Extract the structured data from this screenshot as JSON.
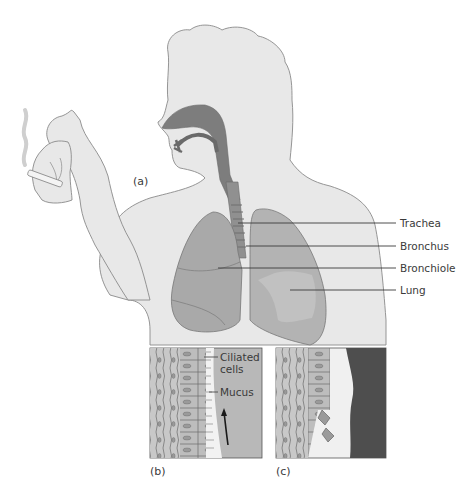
{
  "figure": {
    "panels": [
      {
        "id": "a",
        "label": "(a)"
      },
      {
        "id": "b",
        "label": "(b)"
      },
      {
        "id": "c",
        "label": "(c)"
      }
    ],
    "labels": {
      "trachea": "Trachea",
      "bronchus": "Bronchus",
      "bronchiole": "Bronchiole",
      "lung": "Lung",
      "ciliated_cells_line1": "Ciliated",
      "ciliated_cells_line2": "cells",
      "mucus": "Mucus"
    },
    "colors": {
      "skin": "#e8e8e8",
      "outline": "#8a8a8a",
      "airway": "#7d7d7d",
      "lung_fill": "#a9a9a9",
      "lung_dark": "#8f8f8f",
      "tissue": "#c4c4c4",
      "mucus_bg": "#b8b8b8",
      "tar": "#4e4e4e",
      "text": "#3a3a3a"
    }
  }
}
